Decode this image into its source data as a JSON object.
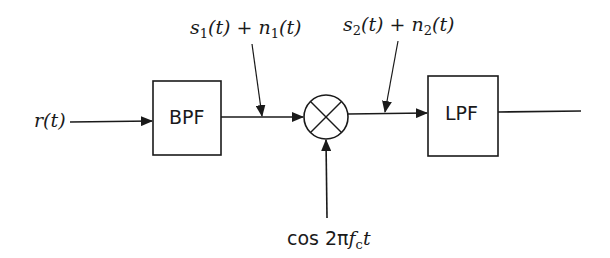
{
  "diagram": {
    "type": "block-diagram",
    "input": {
      "label": "r(t)"
    },
    "blocks": [
      {
        "id": "bpf",
        "label": "BPF"
      },
      {
        "id": "mixer",
        "symbol": "multiplier-circle",
        "label": "×"
      },
      {
        "id": "lpf",
        "label": "LPF"
      }
    ],
    "annotations": {
      "after_bpf": {
        "s": "s",
        "s_sub": "1",
        "paren1": "(t) + ",
        "n": "n",
        "n_sub": "1",
        "paren2": "(t)"
      },
      "after_mixer": {
        "s": "s",
        "s_sub": "2",
        "paren1": "(t) + ",
        "n": "n",
        "n_sub": "2",
        "paren2": "(t)"
      },
      "oscillator": {
        "cos": "cos ",
        "two_pi": "2π",
        "f": "f",
        "f_sub": "c",
        "t": "t"
      }
    },
    "connections": [
      {
        "from": "r(t)",
        "to": "bpf"
      },
      {
        "from": "bpf",
        "to": "mixer"
      },
      {
        "from": "oscillator",
        "to": "mixer"
      },
      {
        "from": "mixer",
        "to": "lpf"
      },
      {
        "from": "lpf",
        "to": "output"
      }
    ]
  }
}
